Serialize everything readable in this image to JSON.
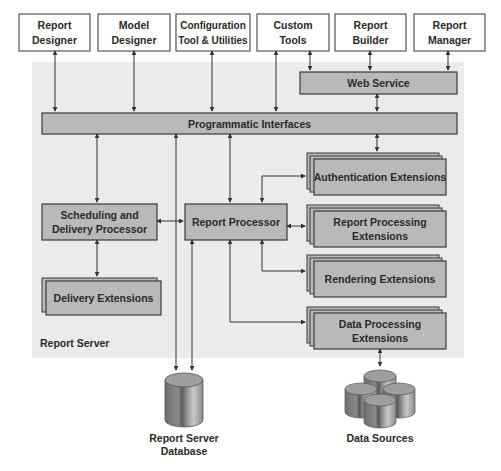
{
  "colors": {
    "server_bg": "#ebebeb",
    "box_fill": "#b9b9b9",
    "box_stroke": "#3a3a3a",
    "client_fill": "#ffffff",
    "line": "#333333",
    "text": "#2a2a2a"
  },
  "clients": [
    {
      "line1": "Report",
      "line2": "Designer"
    },
    {
      "line1": "Model",
      "line2": "Designer"
    },
    {
      "line1": "Configuration",
      "line2": "Tool & Utilities"
    },
    {
      "line1": "Custom",
      "line2": "Tools"
    },
    {
      "line1": "Report",
      "line2": "Builder"
    },
    {
      "line1": "Report",
      "line2": "Manager"
    }
  ],
  "server": {
    "label": "Report Server",
    "web_service": "Web Service",
    "programmatic_interfaces": "Programmatic Interfaces",
    "scheduling": {
      "line1": "Scheduling and",
      "line2": "Delivery Processor"
    },
    "report_processor": "Report Processor",
    "delivery_extensions": "Delivery Extensions",
    "authentication_extensions": "Authentication Extensions",
    "report_processing_extensions": {
      "line1": "Report Processing",
      "line2": "Extensions"
    },
    "rendering_extensions": "Rendering Extensions",
    "data_processing_extensions": {
      "line1": "Data Processing",
      "line2": "Extensions"
    }
  },
  "storage": {
    "database": {
      "line1": "Report Server",
      "line2": "Database"
    },
    "data_sources": "Data Sources"
  }
}
